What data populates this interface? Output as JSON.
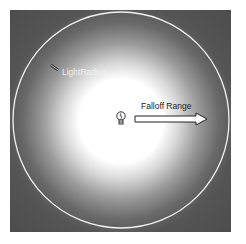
{
  "diagram": {
    "labels": {
      "light_radius": "LightRadius",
      "falloff_range": "Falloff Range"
    },
    "icons": {
      "light_source": "light-bulb-icon",
      "range_arrow": "arrow-right-icon"
    },
    "colors": {
      "background": "#4c4c4c",
      "core": "#ffffff",
      "radius_circle": "#f2f2f2"
    }
  }
}
